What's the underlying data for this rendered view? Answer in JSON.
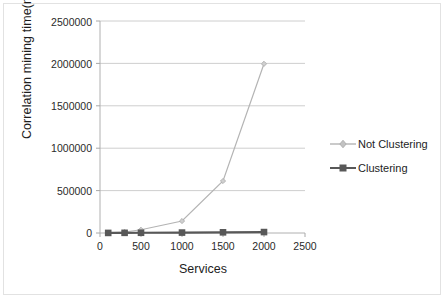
{
  "chart_data": {
    "type": "line",
    "title": "",
    "xlabel": "Services",
    "ylabel": "Correlation mining time(ms)",
    "xlim": [
      0,
      2500
    ],
    "ylim": [
      0,
      2500000
    ],
    "xticks": [
      "0",
      "500",
      "1000",
      "1500",
      "2000",
      "2500"
    ],
    "yticks": [
      "0",
      "500000",
      "1000000",
      "1500000",
      "2000000",
      "2500000"
    ],
    "grid": "horizontal",
    "legend_position": "right",
    "x": [
      100,
      300,
      500,
      1000,
      1500,
      2000
    ],
    "series": [
      {
        "name": "Not Clustering",
        "color": "#b4b4b4",
        "marker": "diamond",
        "values": [
          3000,
          12000,
          38000,
          141000,
          613000,
          1995000
        ]
      },
      {
        "name": "Clustering",
        "color": "#585858",
        "marker": "square",
        "values": [
          1000,
          2000,
          3000,
          5000,
          8000,
          11000
        ]
      }
    ]
  },
  "legend": {
    "items": [
      {
        "label": "Not Clustering"
      },
      {
        "label": "Clustering"
      }
    ]
  },
  "axes": {
    "x_label": "Services",
    "y_label": "Correlation mining time(ms)"
  },
  "colors": {
    "series_not_clustering": "#b4b4b4",
    "series_clustering": "#585858",
    "gridline": "#c8c8c8",
    "axis": "#a8a8a8",
    "text": "#1d1d1d"
  }
}
